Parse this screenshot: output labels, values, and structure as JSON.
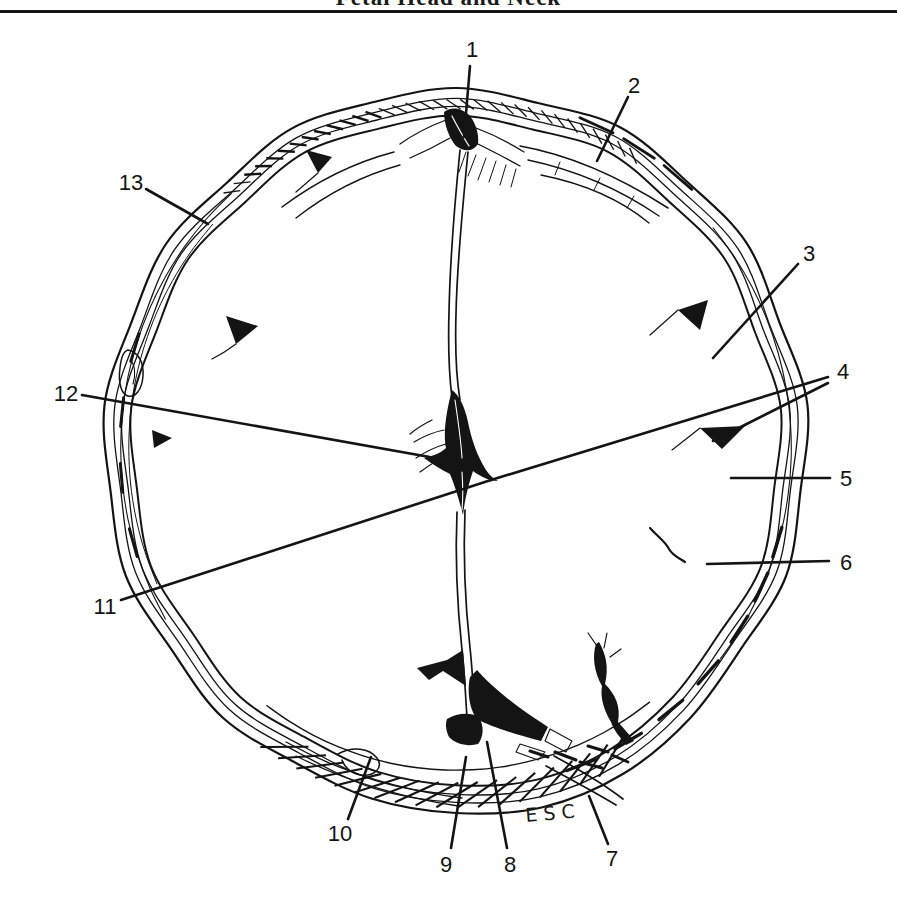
{
  "page": {
    "header_title": "Fetal Head and Neck"
  },
  "figure": {
    "signature": "ESC",
    "labels": [
      {
        "n": "1",
        "x": 472,
        "y": 49,
        "lines": [
          [
            470,
            66,
            464,
            137
          ]
        ]
      },
      {
        "n": "2",
        "x": 634,
        "y": 85,
        "lines": [
          [
            628,
            97,
            597,
            161
          ]
        ]
      },
      {
        "n": "3",
        "x": 809,
        "y": 253,
        "lines": [
          [
            798,
            264,
            713,
            358
          ]
        ]
      },
      {
        "n": "4",
        "x": 843,
        "y": 371,
        "lines": [
          [
            828,
            377,
            491,
            480
          ],
          [
            828,
            383,
            713,
            441
          ]
        ]
      },
      {
        "n": "5",
        "x": 846,
        "y": 478,
        "lines": [
          [
            830,
            478,
            731,
            478
          ]
        ]
      },
      {
        "n": "6",
        "x": 846,
        "y": 562,
        "lines": [
          [
            829,
            561,
            707,
            564
          ]
        ]
      },
      {
        "n": "7",
        "x": 612,
        "y": 858,
        "lines": [
          [
            608,
            844,
            589,
            796
          ]
        ]
      },
      {
        "n": "8",
        "x": 510,
        "y": 864,
        "lines": [
          [
            507,
            848,
            487,
            742
          ]
        ]
      },
      {
        "n": "9",
        "x": 446,
        "y": 864,
        "lines": [
          [
            451,
            848,
            466,
            757
          ]
        ]
      },
      {
        "n": "10",
        "x": 340,
        "y": 833,
        "lines": [
          [
            348,
            819,
            371,
            757
          ]
        ]
      },
      {
        "n": "11",
        "x": 105,
        "y": 606,
        "lines": [
          [
            121,
            600,
            491,
            480
          ]
        ]
      },
      {
        "n": "12",
        "x": 66,
        "y": 393,
        "lines": [
          [
            82,
            395,
            452,
            461
          ]
        ]
      },
      {
        "n": "13",
        "x": 131,
        "y": 182,
        "lines": [
          [
            146,
            189,
            208,
            224
          ]
        ]
      }
    ]
  }
}
